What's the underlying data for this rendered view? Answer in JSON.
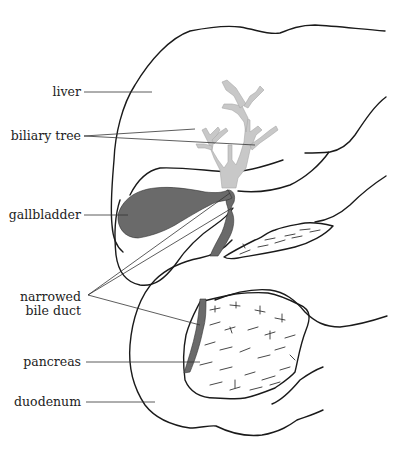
{
  "figure": {
    "labels": {
      "liver": "liver",
      "biliary_tree": "biliary tree",
      "gallbladder": "gallbladder",
      "narrowed_bile_duct_line1": "narrowed",
      "narrowed_bile_duct_line2": "bile duct",
      "pancreas": "pancreas",
      "duodenum": "duodenum"
    },
    "colors": {
      "background": "#ffffff",
      "outline": "#1a1a1a",
      "biliary_tree_fill": "#c8c8c8",
      "gallbladder_fill": "#6a6a6a",
      "bile_duct_fill": "#6a6a6a",
      "label_text": "#222222"
    }
  }
}
